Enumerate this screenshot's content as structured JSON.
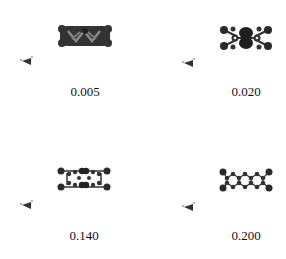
{
  "figure": {
    "panels": [
      {
        "label": "0.005",
        "style": "surface"
      },
      {
        "label": "0.020",
        "style": "partial-surface"
      },
      {
        "label": "0.140",
        "style": "ball-and-stick"
      },
      {
        "label": "0.200",
        "style": "ball-and-stick"
      }
    ],
    "colors": {
      "atom": "#2a2a2a",
      "surface": "#3a3a3a",
      "background": "#ffffff"
    }
  }
}
